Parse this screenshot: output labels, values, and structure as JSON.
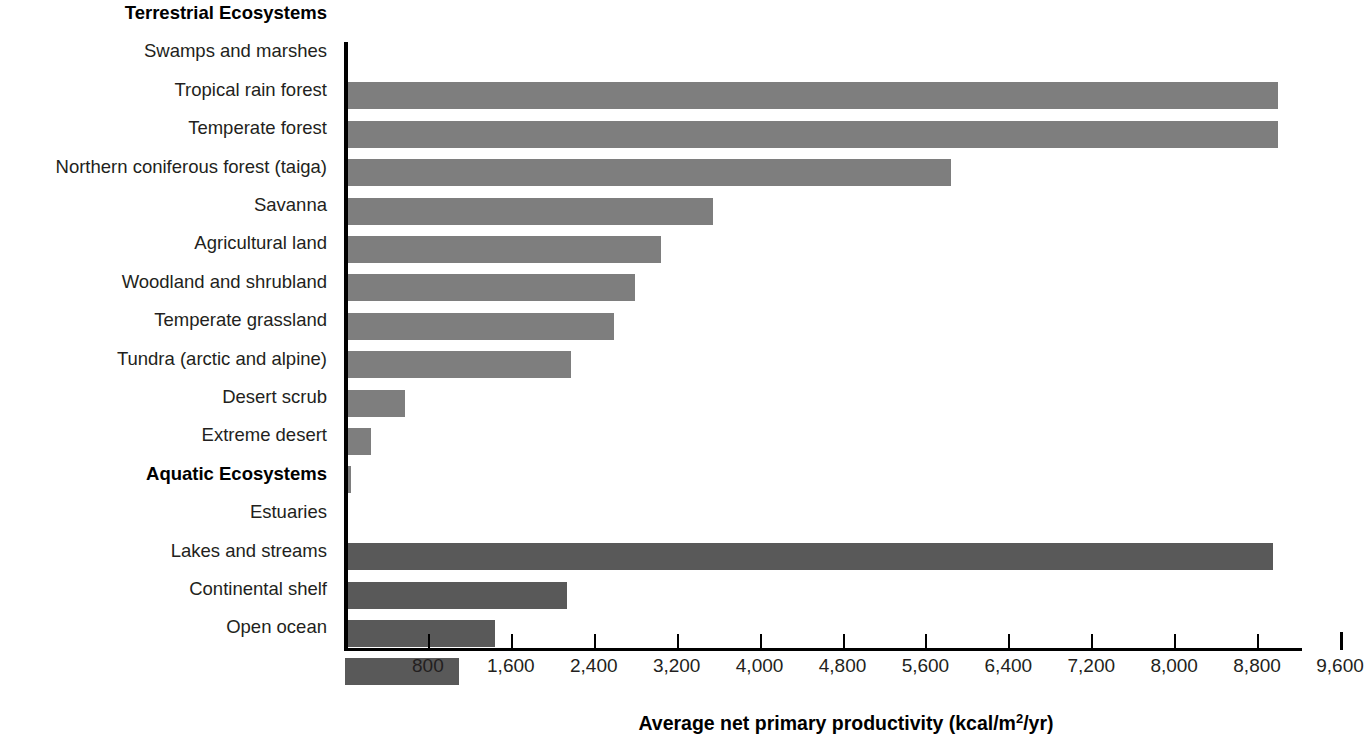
{
  "chart_data": {
    "type": "bar",
    "orientation": "horizontal",
    "title": "",
    "xlabel": "Average net primary productivity (kcal/m2/yr)",
    "xlabel_parts": {
      "before_sup": "Average net primary productivity (kcal/m",
      "sup": "2",
      "after_sup": "/yr)"
    },
    "ylabel": "",
    "xlim": [
      0,
      9600
    ],
    "xticks": [
      800,
      1600,
      2400,
      3200,
      4000,
      4800,
      5600,
      6400,
      7200,
      8000,
      8800,
      9600
    ],
    "xtick_labels": [
      "800",
      "1,600",
      "2,400",
      "3,200",
      "4,000",
      "4,800",
      "5,600",
      "6,400",
      "7,200",
      "8,000",
      "8,800",
      "9,600"
    ],
    "grid": false,
    "legend": "none",
    "group_headers": [
      "Terrestrial Ecosystems",
      "Aquatic Ecosystems"
    ],
    "colors": {
      "terrestrial_bar": "#7e7e7e",
      "aquatic_bar": "#595959",
      "axis": "#000000",
      "text": "#231f20"
    },
    "rows": [
      {
        "kind": "group",
        "label": "Terrestrial Ecosystems"
      },
      {
        "kind": "bar",
        "label": "Swamps and marshes",
        "value": 9000,
        "group": "terrestrial"
      },
      {
        "kind": "bar",
        "label": "Tropical rain forest",
        "value": 9000,
        "group": "terrestrial"
      },
      {
        "kind": "bar",
        "label": "Temperate forest",
        "value": 5850,
        "group": "terrestrial"
      },
      {
        "kind": "bar",
        "label": "Northern coniferous forest (taiga)",
        "value": 3550,
        "group": "terrestrial"
      },
      {
        "kind": "bar",
        "label": "Savanna",
        "value": 3050,
        "group": "terrestrial"
      },
      {
        "kind": "bar",
        "label": "Agricultural land",
        "value": 2800,
        "group": "terrestrial"
      },
      {
        "kind": "bar",
        "label": "Woodland and shrubland",
        "value": 2600,
        "group": "terrestrial"
      },
      {
        "kind": "bar",
        "label": "Temperate grassland",
        "value": 2180,
        "group": "terrestrial"
      },
      {
        "kind": "bar",
        "label": "Tundra (arctic and alpine)",
        "value": 580,
        "group": "terrestrial"
      },
      {
        "kind": "bar",
        "label": "Desert scrub",
        "value": 250,
        "group": "terrestrial"
      },
      {
        "kind": "bar",
        "label": "Extreme desert",
        "value": 60,
        "group": "terrestrial"
      },
      {
        "kind": "group",
        "label": "Aquatic Ecosystems"
      },
      {
        "kind": "bar",
        "label": "Estuaries",
        "value": 8950,
        "group": "aquatic"
      },
      {
        "kind": "bar",
        "label": "Lakes and streams",
        "value": 2140,
        "group": "aquatic"
      },
      {
        "kind": "bar",
        "label": "Continental shelf",
        "value": 1450,
        "group": "aquatic"
      },
      {
        "kind": "bar",
        "label": "Open ocean",
        "value": 1100,
        "group": "aquatic"
      }
    ]
  }
}
